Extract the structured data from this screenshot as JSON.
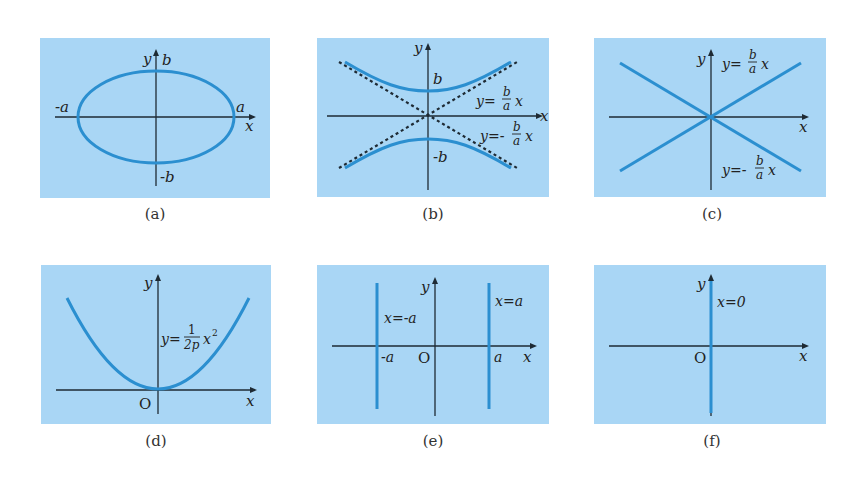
{
  "colors": {
    "panel_bg": "#a9d6f5",
    "curve": "#2b8fd0",
    "axis": "#1e2a33",
    "caption": "#333333"
  },
  "panels": [
    {
      "id": "a",
      "caption": "(a)",
      "curve_type": "ellipse",
      "labels": {
        "y_axis": "y",
        "x_axis": "x",
        "top": "b",
        "bottom": "-b",
        "left": "-a",
        "right": "a"
      }
    },
    {
      "id": "b",
      "caption": "(b)",
      "curve_type": "hyperbola",
      "labels": {
        "y_axis": "y",
        "x_axis": "x",
        "top": "b",
        "bottom": "-b",
        "asym_pos": "y=",
        "asym_neg": "y=-",
        "frac_num": "b",
        "frac_den": "a",
        "var": "x"
      }
    },
    {
      "id": "c",
      "caption": "(c)",
      "curve_type": "line-pair",
      "labels": {
        "y_axis": "y",
        "x_axis": "x",
        "line_pos": "y=",
        "line_neg": "y=-",
        "frac_num": "b",
        "frac_den": "a",
        "var": "x"
      }
    },
    {
      "id": "d",
      "caption": "(d)",
      "curve_type": "parabola",
      "labels": {
        "y_axis": "y",
        "x_axis": "x",
        "origin": "O",
        "eq_lhs": "y=",
        "frac_num": "1",
        "frac_den": "2p",
        "var": "x",
        "exp": "2"
      }
    },
    {
      "id": "e",
      "caption": "(e)",
      "curve_type": "parallel-lines",
      "labels": {
        "y_axis": "y",
        "x_axis": "x",
        "origin": "O",
        "left_eq": "x=-a",
        "right_eq": "x=a",
        "left_tick": "-a",
        "right_tick": "a"
      }
    },
    {
      "id": "f",
      "caption": "(f)",
      "curve_type": "single-line",
      "labels": {
        "y_axis": "y",
        "x_axis": "x",
        "origin": "O",
        "eq": "x=0"
      }
    }
  ]
}
